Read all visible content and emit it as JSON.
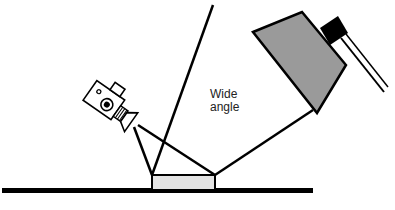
{
  "diagram": {
    "labels": {
      "wide_line1": "Wide",
      "wide_line2": "angle"
    },
    "elements": {
      "camera": "video-camera-icon",
      "light": "softbox-light",
      "subject": "subject-box",
      "ground": "ground-line"
    },
    "colors": {
      "stroke": "#000000",
      "light_fill": "#9a9a9a",
      "subject_fill": "#e3e3e3",
      "background": "#ffffff"
    }
  }
}
